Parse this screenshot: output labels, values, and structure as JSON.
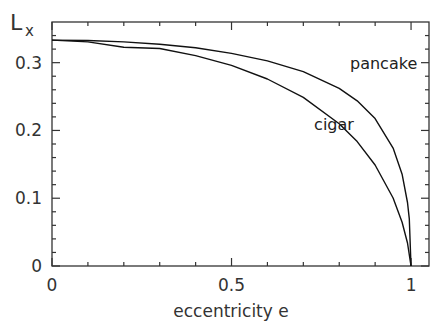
{
  "chart_data": {
    "type": "line",
    "title": "",
    "xlabel": "eccentricity e",
    "ylabel": "L",
    "ylabel_subscript": "x",
    "xlim": [
      0,
      1.05
    ],
    "ylim": [
      0,
      0.36
    ],
    "grid": false,
    "legend": "inline labels",
    "x_ticks": [
      0,
      0.5,
      1
    ],
    "x_tick_labels": [
      "0",
      "0.5",
      "1"
    ],
    "y_ticks": [
      0,
      0.1,
      0.2,
      0.3
    ],
    "y_tick_labels": [
      "0",
      "0.1",
      "0.2",
      "0.3"
    ],
    "series": [
      {
        "name": "pancake",
        "x": [
          0,
          0.1,
          0.2,
          0.3,
          0.4,
          0.5,
          0.6,
          0.7,
          0.8,
          0.85,
          0.9,
          0.95,
          0.975,
          0.99,
          0.995,
          1.0
        ],
        "values": [
          0.3333,
          0.3327,
          0.3307,
          0.3273,
          0.3219,
          0.3136,
          0.3026,
          0.2868,
          0.262,
          0.2437,
          0.2175,
          0.174,
          0.1355,
          0.0937,
          0.0696,
          0.0
        ]
      },
      {
        "name": "cigar",
        "x": [
          0,
          0.1,
          0.2,
          0.3,
          0.4,
          0.5,
          0.6,
          0.7,
          0.8,
          0.85,
          0.9,
          0.95,
          0.975,
          0.99,
          1.0
        ],
        "values": [
          0.3333,
          0.3307,
          0.3228,
          0.3209,
          0.3104,
          0.296,
          0.2759,
          0.2488,
          0.21,
          0.1836,
          0.149,
          0.1003,
          0.0645,
          0.034,
          0.0
        ]
      }
    ],
    "annotations": [
      {
        "text": "pancake",
        "x": 0.83,
        "y": 0.29
      },
      {
        "text": "cigar",
        "x": 0.73,
        "y": 0.2
      }
    ]
  }
}
